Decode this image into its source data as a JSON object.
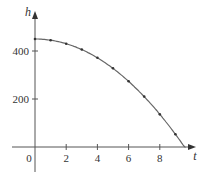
{
  "chart_data": {
    "type": "line",
    "title": "",
    "xlabel": "t",
    "ylabel": "h",
    "x": [
      0,
      1,
      2,
      3,
      4,
      5,
      6,
      7,
      8,
      9
    ],
    "series": [
      {
        "name": "h(t)",
        "values": [
          450,
          445,
          430,
          406,
          372,
          328,
          274,
          210,
          136,
          53
        ],
        "markers": true,
        "color": "#666666"
      }
    ],
    "curve_end": {
      "t": 9.6,
      "h": 0
    },
    "x_ticks": [
      0,
      2,
      4,
      6,
      8
    ],
    "y_ticks": [
      200,
      400
    ],
    "x_tick_labels": [
      "0",
      "2",
      "4",
      "6",
      "8"
    ],
    "y_tick_labels": [
      "200",
      "400"
    ],
    "xlim": [
      -1.5,
      10.3
    ],
    "ylim": [
      -100,
      560
    ],
    "grid": false,
    "legend": null
  }
}
